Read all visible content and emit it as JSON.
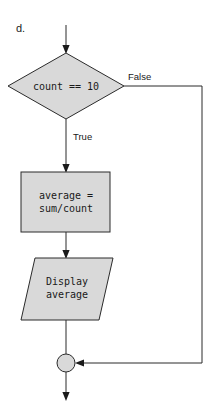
{
  "figure": {
    "part_label": "d.",
    "colors": {
      "shape_fill": "#d9d9d9",
      "shape_stroke": "#2b2b2b",
      "arrow": "#1a1a1a",
      "background": "#ffffff"
    }
  },
  "nodes": {
    "decision": {
      "shape": "diamond",
      "text": "count == 10"
    },
    "process": {
      "shape": "rectangle",
      "text_line1": "average =",
      "text_line2": "sum/count"
    },
    "output": {
      "shape": "parallelogram",
      "text_line1": "Display",
      "text_line2": "average"
    },
    "connector": {
      "shape": "circle",
      "text": ""
    }
  },
  "edges": {
    "entry": {
      "label": ""
    },
    "true_branch": {
      "label": "True"
    },
    "false_branch": {
      "label": "False"
    },
    "process_to_output": {
      "label": ""
    },
    "output_to_connector": {
      "label": ""
    },
    "exit": {
      "label": ""
    }
  }
}
